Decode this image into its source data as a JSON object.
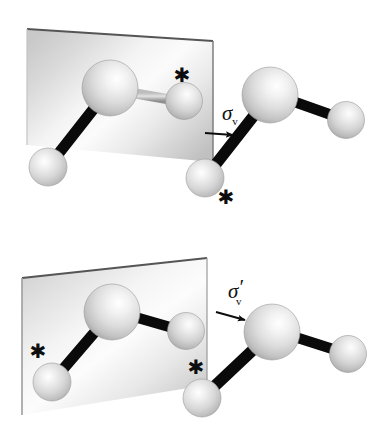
{
  "figure": {
    "type": "molecular-symmetry-diagram",
    "background_color": "#ffffff",
    "panels": [
      {
        "id": "panel-top",
        "operation_label": {
          "symbol": "σ",
          "subscript": "v",
          "prime": "",
          "full": "σv"
        },
        "plane": {
          "name": "mirror-plane",
          "edge_color": "#4a4a4a",
          "fill_light": "#ffffff",
          "fill_dark": "#b8b8b8"
        },
        "molecule_in_plane": {
          "name": "original-molecule",
          "atoms": [
            {
              "label": "central-atom",
              "size": "large",
              "marked": false
            },
            {
              "label": "outer-atom-left",
              "size": "small",
              "marked": false
            },
            {
              "label": "outer-atom-right",
              "size": "small",
              "marked": true
            }
          ],
          "bond_style_left": "black",
          "bond_style_right": "grey"
        },
        "molecule_reflected": {
          "name": "reflected-molecule",
          "atoms": [
            {
              "label": "central-atom",
              "size": "large",
              "marked": false
            },
            {
              "label": "outer-atom-lower",
              "size": "small",
              "marked": true
            },
            {
              "label": "outer-atom-right",
              "size": "small",
              "marked": false
            }
          ]
        },
        "markers": [
          {
            "name": "asterisk-in-plane",
            "glyph": "✱"
          },
          {
            "name": "asterisk-reflected",
            "glyph": "✱"
          }
        ],
        "arrow": {
          "name": "reflection-arrow",
          "direction": "right"
        }
      },
      {
        "id": "panel-bottom",
        "operation_label": {
          "symbol": "σ",
          "subscript": "v",
          "prime": "′",
          "full": "σ′v"
        },
        "plane": {
          "name": "mirror-plane",
          "edge_color": "#4a4a4a",
          "fill_light": "#ffffff",
          "fill_dark": "#b8b8b8"
        },
        "molecule_in_plane": {
          "name": "original-molecule",
          "atoms": [
            {
              "label": "central-atom",
              "size": "large",
              "marked": false
            },
            {
              "label": "outer-atom-lower-left",
              "size": "small",
              "marked": true
            },
            {
              "label": "outer-atom-right",
              "size": "small",
              "marked": false
            }
          ],
          "bond_style_left": "black",
          "bond_style_right": "black"
        },
        "molecule_reflected": {
          "name": "reflected-molecule",
          "atoms": [
            {
              "label": "central-atom",
              "size": "large",
              "marked": false
            },
            {
              "label": "outer-atom-lower-left",
              "size": "small",
              "marked": true
            },
            {
              "label": "outer-atom-right",
              "size": "small",
              "marked": false
            }
          ]
        },
        "markers": [
          {
            "name": "asterisk-in-plane",
            "glyph": "✱"
          },
          {
            "name": "asterisk-reflected",
            "glyph": "✱"
          }
        ],
        "arrow": {
          "name": "reflection-arrow",
          "direction": "right"
        }
      }
    ],
    "colors": {
      "sphere_light": "#ffffff",
      "sphere_mid": "#d0d0d0",
      "sphere_edge": "#8f8f8f",
      "bond_black": "#0a0a0a",
      "bond_grey": "#9a9a9a",
      "plane_edge": "#4a4a4a",
      "text": "#111111"
    }
  }
}
